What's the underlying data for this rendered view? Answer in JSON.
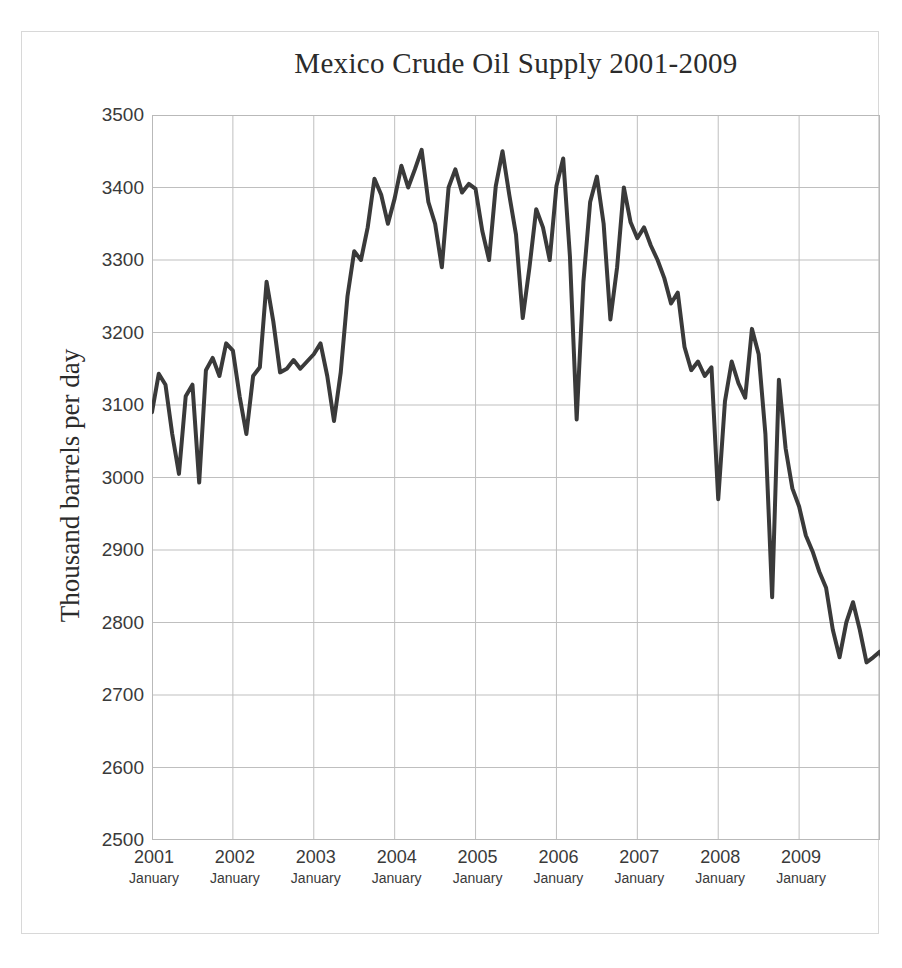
{
  "chart_data": {
    "type": "line",
    "title": "Mexico Crude Oil Supply 2001-2009",
    "xlabel": "",
    "ylabel": "Thousand barrels per day",
    "ylim": [
      2500,
      3500
    ],
    "yticks": [
      3500,
      3400,
      3300,
      3200,
      3100,
      3000,
      2900,
      2800,
      2700,
      2600,
      2500
    ],
    "ytick_labels": [
      "3500",
      "3400",
      "3300",
      "3200",
      "3100",
      "3000",
      "2900",
      "2800",
      "2700",
      "2600",
      "2500"
    ],
    "xticks": [
      "2001",
      "2002",
      "2003",
      "2004",
      "2005",
      "2006",
      "2007",
      "2008",
      "2009"
    ],
    "xtick_sublabels": [
      "January",
      "January",
      "January",
      "January",
      "January",
      "January",
      "January",
      "January",
      "January"
    ],
    "xtick_major_label": "January",
    "grid": true,
    "legend": "none",
    "series": [
      {
        "name": "Mexico Crude Oil Supply",
        "color": "#3a3a3a",
        "line_width": 4,
        "x_start_year": 2001,
        "x_start_month": 1,
        "x_step_months": 1,
        "values": [
          3090,
          3143,
          3128,
          3060,
          3005,
          3112,
          3128,
          2993,
          3148,
          3165,
          3140,
          3185,
          3175,
          3112,
          3060,
          3140,
          3152,
          3270,
          3215,
          3145,
          3150,
          3162,
          3150,
          3160,
          3170,
          3185,
          3140,
          3078,
          3145,
          3250,
          3312,
          3300,
          3345,
          3412,
          3390,
          3350,
          3385,
          3430,
          3400,
          3425,
          3452,
          3380,
          3350,
          3290,
          3400,
          3425,
          3393,
          3405,
          3398,
          3340,
          3300,
          3402,
          3450,
          3390,
          3335,
          3220,
          3290,
          3370,
          3345,
          3300,
          3402,
          3440,
          3305,
          3080,
          3270,
          3380,
          3415,
          3350,
          3218,
          3290,
          3400,
          3352,
          3330,
          3345,
          3320,
          3300,
          3275,
          3240,
          3255,
          3180,
          3148,
          3160,
          3140,
          3152,
          2970,
          3105,
          3160,
          3130,
          3110,
          3205,
          3170,
          3060,
          2835,
          3135,
          3040,
          2985,
          2960,
          2920,
          2898,
          2870,
          2848,
          2790,
          2752,
          2800,
          2828,
          2790,
          2745,
          2752,
          2760,
          2730,
          2700,
          2698,
          2690,
          2660,
          2645,
          2640,
          2600,
          2555,
          2515,
          2555,
          2535,
          2570,
          2590,
          2560,
          2580
        ]
      }
    ]
  },
  "title": "Mexico Crude Oil Supply 2001-2009"
}
